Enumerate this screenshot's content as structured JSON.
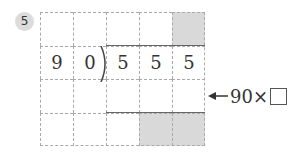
{
  "problem_number": "5",
  "grid": {
    "rows": 4,
    "cols": 5,
    "cells": [
      [
        "",
        "",
        "",
        "",
        ""
      ],
      [
        "9",
        "0",
        "5",
        "5",
        "5"
      ],
      [
        "",
        "",
        "",
        "",
        ""
      ],
      [
        "",
        "",
        "",
        "",
        ""
      ]
    ],
    "shaded": [
      [
        0,
        4
      ],
      [
        3,
        3
      ],
      [
        3,
        4
      ]
    ]
  },
  "annotation": {
    "prefix": "90×",
    "box_value": ""
  },
  "colors": {
    "shade": "#d9d9d9",
    "line": "#666666",
    "grid": "#aaaaaa"
  }
}
